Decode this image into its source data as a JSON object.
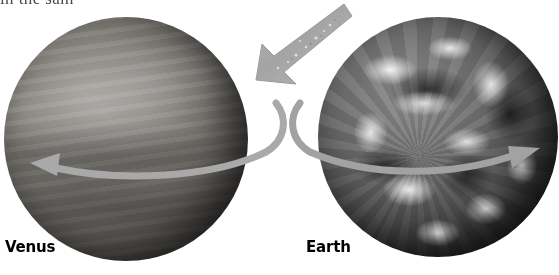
{
  "figure": {
    "caption_clipped": "in the sam",
    "background_color": "#ffffff"
  },
  "planets": [
    {
      "id": "venus",
      "label": "Venus",
      "rotation_direction": "leftward-retrograde",
      "arrow_label": "venus-rotation-arrow"
    },
    {
      "id": "earth",
      "label": "Earth",
      "rotation_direction": "rightward-prograde",
      "arrow_label": "earth-rotation-arrow"
    }
  ],
  "connector": {
    "name": "comparison-arrow",
    "direction": "down-left",
    "from": "earth",
    "to": "venus"
  },
  "colors": {
    "arrow_gray": "#a9a9a9",
    "arrow_gray_dark": "#9a9a9a",
    "label_black": "#000000",
    "caption_gray": "#4a4a4a"
  }
}
